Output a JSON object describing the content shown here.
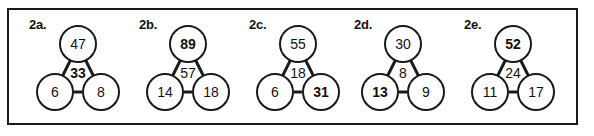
{
  "worksheet": {
    "background_color": "#ffffff",
    "border_color": "#1a1a1a",
    "text_color": "#111111",
    "problems": [
      {
        "id": "2a",
        "label": "2a.",
        "left": 14,
        "top": {
          "value": "47",
          "bold": false
        },
        "center": {
          "value": "33",
          "bold": true
        },
        "bottom_left": {
          "value": "6",
          "bold": false
        },
        "bottom_right": {
          "value": "8",
          "bold": false
        }
      },
      {
        "id": "2b",
        "label": "2b.",
        "left": 124,
        "top": {
          "value": "89",
          "bold": true
        },
        "center": {
          "value": "57",
          "bold": false
        },
        "bottom_left": {
          "value": "14",
          "bold": false
        },
        "bottom_right": {
          "value": "18",
          "bold": false
        }
      },
      {
        "id": "2c",
        "label": "2c.",
        "left": 234,
        "top": {
          "value": "55",
          "bold": false
        },
        "center": {
          "value": "18",
          "bold": false
        },
        "bottom_left": {
          "value": "6",
          "bold": false
        },
        "bottom_right": {
          "value": "31",
          "bold": true
        }
      },
      {
        "id": "2d",
        "label": "2d.",
        "left": 339,
        "top": {
          "value": "30",
          "bold": false
        },
        "center": {
          "value": "8",
          "bold": false
        },
        "bottom_left": {
          "value": "13",
          "bold": true
        },
        "bottom_right": {
          "value": "9",
          "bold": false
        }
      },
      {
        "id": "2e",
        "label": "2e.",
        "left": 449,
        "top": {
          "value": "52",
          "bold": true
        },
        "center": {
          "value": "24",
          "bold": false
        },
        "bottom_left": {
          "value": "11",
          "bold": false
        },
        "bottom_right": {
          "value": "17",
          "bold": false
        }
      }
    ]
  }
}
